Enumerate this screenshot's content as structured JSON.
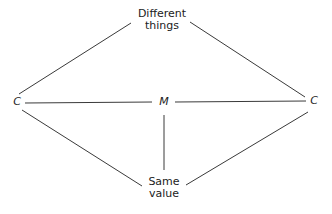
{
  "diagram": {
    "nodes": {
      "top": {
        "label_line1": "Different",
        "label_line2": "things"
      },
      "bottom": {
        "label_line1": "Same",
        "label_line2": "value"
      },
      "left": {
        "label": "C"
      },
      "right": {
        "label": "C"
      },
      "center": {
        "label": "M"
      }
    },
    "edges": [
      {
        "from": "left",
        "to": "top"
      },
      {
        "from": "top",
        "to": "right"
      },
      {
        "from": "left",
        "to": "center"
      },
      {
        "from": "center",
        "to": "right"
      },
      {
        "from": "center",
        "to": "bottom"
      },
      {
        "from": "left",
        "to": "bottom"
      },
      {
        "from": "bottom",
        "to": "right"
      }
    ],
    "line_color": "#3a3a3a"
  }
}
